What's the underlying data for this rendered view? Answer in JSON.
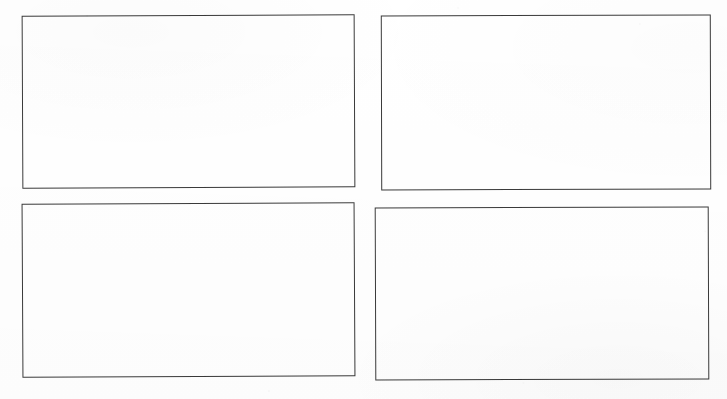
{
  "document": {
    "kind": "blank-four-panel-worksheet",
    "title": "",
    "background_color": "#ffffff",
    "page_width": 727,
    "page_height": 399,
    "text_content": "",
    "notes": ""
  },
  "style": {
    "border_color": "#3a3a3a",
    "border_color_light": "#555555",
    "panel_fill": "#ffffff",
    "border_width_px": 1.5
  },
  "panels": [
    {
      "id": "panel-top-left",
      "label": "",
      "content": "",
      "position": "top-left",
      "x": 22,
      "y": 15,
      "width": 333,
      "height": 173,
      "rotation_deg": -0.25,
      "border_color": "#3a3a3a",
      "border_width": 1.5,
      "fill": "#ffffff"
    },
    {
      "id": "panel-top-right",
      "label": "",
      "content": "",
      "position": "top-right",
      "x": 381,
      "y": 15,
      "width": 330,
      "height": 175,
      "rotation_deg": -0.15,
      "border_color": "#3a3a3a",
      "border_width": 1.5,
      "fill": "#ffffff"
    },
    {
      "id": "panel-bottom-left",
      "label": "",
      "content": "",
      "position": "bottom-left",
      "x": 22,
      "y": 203,
      "width": 333,
      "height": 174,
      "rotation_deg": -0.3,
      "border_color": "#3a3a3a",
      "border_width": 1.5,
      "fill": "#ffffff"
    },
    {
      "id": "panel-bottom-right",
      "label": "",
      "content": "",
      "position": "bottom-right",
      "x": 375,
      "y": 207,
      "width": 334,
      "height": 173,
      "rotation_deg": -0.2,
      "border_color": "#3a3a3a",
      "border_width": 1.5,
      "fill": "#ffffff"
    }
  ]
}
